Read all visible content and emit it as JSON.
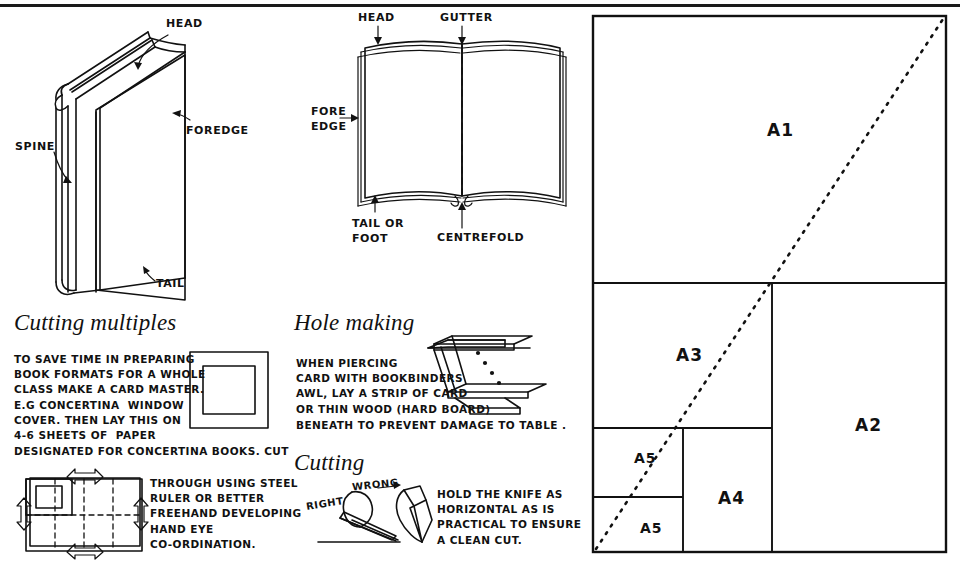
{
  "page": {
    "background": "#ffffff",
    "ink_color": "#111111"
  },
  "closed_book": {
    "labels": {
      "head": "HEAD",
      "foredge": "FOREDGE",
      "spine": "SPINE",
      "tail": "TAIL"
    }
  },
  "open_book": {
    "labels": {
      "head": "HEAD",
      "gutter": "GUTTER",
      "fore_edge_line1": "FORE",
      "fore_edge_line2": "EDGE",
      "tail_line1": "TAIL OR",
      "tail_line2": "FOOT",
      "centrefold": "CENTREFOLD"
    }
  },
  "cutting_multiples": {
    "heading": "Cutting multiples",
    "paragraph_lines": [
      "TO SAVE TIME IN PREPARING",
      "BOOK FORMATS FOR A WHOLE",
      "CLASS MAKE A CARD MASTER.",
      "E.G CONCERTINA  WINDOW",
      "COVER. THEN LAY THIS ON",
      "4-6 SHEETS OF  PAPER"
    ],
    "paragraph_wide_line": "DESIGNATED FOR CONCERTINA BOOKS. CUT",
    "paragraph_right_lines": [
      "THROUGH USING STEEL",
      "RULER OR BETTER",
      "FREEHAND DEVELOPING",
      "HAND EYE",
      "CO-ORDINATION."
    ]
  },
  "hole_making": {
    "heading": "Hole making",
    "paragraph_lines": [
      "WHEN PIERCING",
      "CARD WITH BOOKBINDERS",
      "AWL, LAY A STRIP OF CARD",
      "OR THIN WOOD (HARD BOARD)"
    ],
    "paragraph_wide_line": "BENEATH TO PREVENT DAMAGE TO TABLE ."
  },
  "cutting": {
    "heading": "Cutting",
    "label_right": "RIGHT",
    "label_wrong": "WRONG",
    "paragraph_lines": [
      "HOLD THE KNIFE AS",
      "HORIZONTAL AS IS",
      "PRACTICAL TO ENSURE",
      "A CLEAN CUT."
    ]
  },
  "paper_sizes": {
    "panel_label": "A series paper size subdivision",
    "sizes": [
      {
        "label": "A1",
        "x": 767,
        "y": 120
      },
      {
        "label": "A2",
        "x": 855,
        "y": 415
      },
      {
        "label": "A3",
        "x": 676,
        "y": 345
      },
      {
        "label": "A4",
        "x": 718,
        "y": 488
      },
      {
        "label": "A5",
        "x": 634,
        "y": 450
      },
      {
        "label": "A5",
        "x": 640,
        "y": 520
      }
    ],
    "diagonal": "dotted diagonal from bottom-left to top-right"
  }
}
